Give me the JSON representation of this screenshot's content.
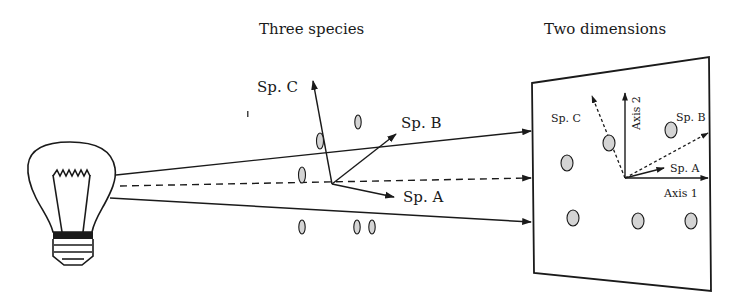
{
  "titles": {
    "three_species": "Three species",
    "two_dimensions": "Two dimensions"
  },
  "left_axes": {
    "sp_a": "Sp. A",
    "sp_b": "Sp. B",
    "sp_c": "Sp. C"
  },
  "panel": {
    "sp_a": "Sp. A",
    "sp_b": "Sp. B",
    "sp_c": "Sp. C",
    "axis_1": "Axis 1",
    "axis_2": "Axis 2"
  },
  "colors": {
    "ink": "#1a1a1a",
    "point_fill": "#d4d4d4",
    "background": "#ffffff"
  }
}
